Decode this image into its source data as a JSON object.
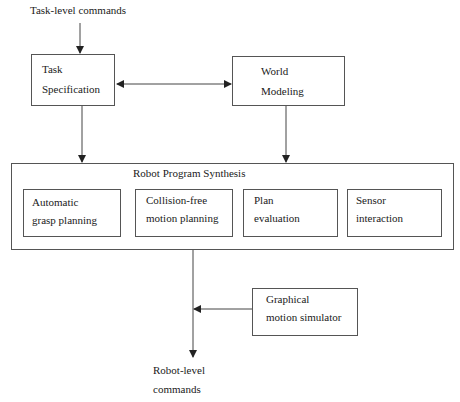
{
  "diagram": {
    "input_label": "Task-level commands",
    "task_specification": {
      "line1": "Task",
      "line2": "Specification"
    },
    "world_modeling": {
      "line1": "World",
      "line2": "Modeling"
    },
    "synthesis": {
      "title": "Robot Program Synthesis",
      "modules": [
        {
          "line1": "Automatic",
          "line2": "grasp planning"
        },
        {
          "line1": "Collision-free",
          "line2": "motion planning"
        },
        {
          "line1": "Plan",
          "line2": "evaluation"
        },
        {
          "line1": "Sensor",
          "line2": "interaction"
        }
      ]
    },
    "simulator": {
      "line1": "Graphical",
      "line2": "motion simulator"
    },
    "output_label": {
      "line1": "Robot-level",
      "line2": "commands"
    }
  },
  "colors": {
    "line": "#444444",
    "text": "#1a1a1a",
    "background": "#ffffff"
  }
}
